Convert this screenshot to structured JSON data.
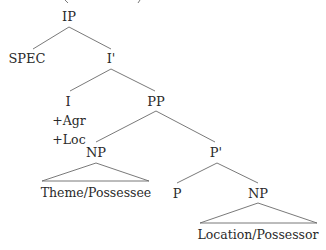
{
  "tree": {
    "root": "IP",
    "nodes": {
      "ip": "IP",
      "spec": "SPEC",
      "i_bar": "I'",
      "i": "I",
      "i_features": [
        "+Agr",
        "+Loc"
      ],
      "pp": "PP",
      "np_theme": "NP",
      "theme_leaf": "Theme/Possessee",
      "p_bar": "P'",
      "p": "P",
      "np_location": "NP",
      "location_leaf": "Location/Possessor"
    },
    "edges": [
      [
        "IP",
        "SPEC"
      ],
      [
        "IP",
        "I'"
      ],
      [
        "I'",
        "I"
      ],
      [
        "I'",
        "PP"
      ],
      [
        "PP",
        "NP"
      ],
      [
        "PP",
        "P'"
      ],
      [
        "P'",
        "P"
      ],
      [
        "P'",
        "NP"
      ]
    ],
    "triangles": [
      "NP (Theme/Possessee)",
      "NP (Location/Possessor)"
    ]
  },
  "colors": {
    "line": "#5a5a5a",
    "text": "#2a2a2a"
  }
}
